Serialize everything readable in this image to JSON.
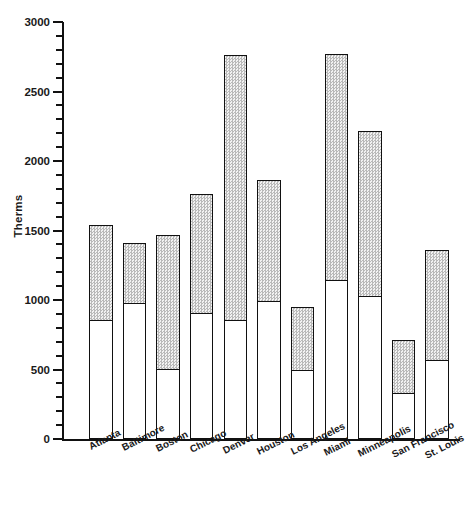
{
  "chart_data": {
    "type": "bar",
    "subtype": "stacked-bar",
    "title": "",
    "xlabel": "",
    "ylabel": "Therms",
    "ylim": [
      0,
      3000
    ],
    "ytick_interval": 500,
    "yminor_interval": 100,
    "ytick_labels": [
      "0",
      "500",
      "1000",
      "1500",
      "2000",
      "2500",
      "3000"
    ],
    "ytick_values": [
      0,
      500,
      1000,
      1500,
      2000,
      2500,
      3000
    ],
    "grid": false,
    "legend": false,
    "categories": [
      "Atlanta",
      "Baltimore",
      "Boston",
      "Chicago",
      "Denver",
      "Houston",
      "Los Angeles",
      "Miami",
      "Minneapolis",
      "San Francisco",
      "St. Louis"
    ],
    "series": [
      {
        "name": "lower-segment",
        "style": "white-fill",
        "values": [
          860,
          980,
          510,
          910,
          860,
          1000,
          500,
          1150,
          1030,
          335,
          575
        ]
      },
      {
        "name": "upper-segment",
        "style": "gray-dotted-fill",
        "values": [
          680,
          430,
          955,
          850,
          1900,
          865,
          450,
          1620,
          1185,
          380,
          785
        ]
      }
    ],
    "totals": [
      1540,
      1410,
      1465,
      1760,
      2760,
      1865,
      950,
      2770,
      2215,
      715,
      1360
    ]
  },
  "colors": {
    "axis": "#111111",
    "bar_outline": "#111111",
    "lower_fill": "#ffffff",
    "upper_fill": "#d2d2d2",
    "text": "#1a1a1a",
    "background": "#ffffff"
  }
}
